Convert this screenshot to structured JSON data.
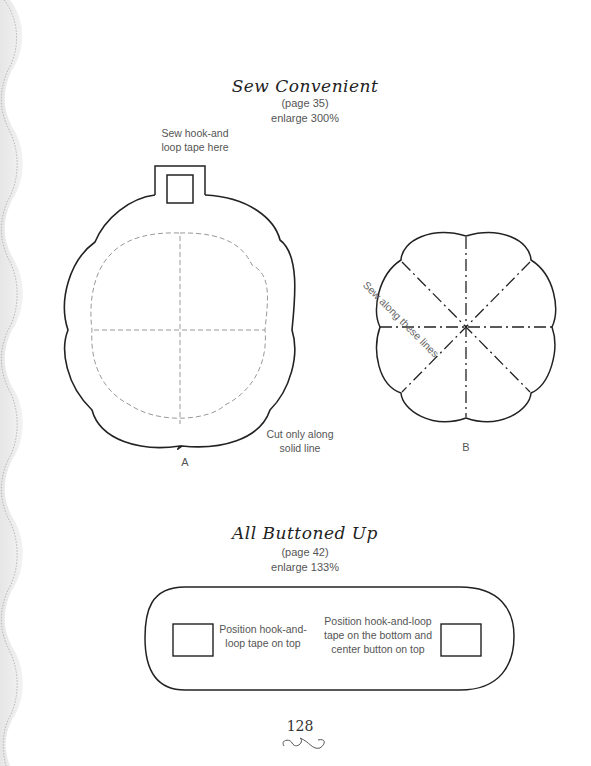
{
  "pattern1": {
    "title": "Sew Convenient",
    "page_ref": "(page 35)",
    "enlarge": "enlarge 300%",
    "tab_note_line1": "Sew hook-and",
    "tab_note_line2": "loop tape here",
    "cut_note_line1": "Cut only along",
    "cut_note_line2": "solid line",
    "label_a": "A",
    "label_b": "B",
    "sew_lines_note": "Sew along these lines"
  },
  "pattern2": {
    "title": "All Buttoned Up",
    "page_ref": "(page 42)",
    "enlarge": "enlarge 133%",
    "left_note_line1": "Position hook-and-",
    "left_note_line2": "loop tape on top",
    "right_note_line1": "Position hook-and-loop",
    "right_note_line2": "tape on the bottom and",
    "right_note_line3": "center button on top"
  },
  "footer": {
    "page_number": "128",
    "ornament": "flourish-ornament"
  },
  "colors": {
    "outline": "#222222",
    "dashed": "#999999",
    "border_wave": "#d8d8d8"
  }
}
